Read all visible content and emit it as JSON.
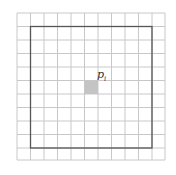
{
  "diagram": {
    "grid": {
      "x_lines": [
        17,
        30.5,
        44,
        57.5,
        71,
        84.5,
        98,
        111.5,
        125,
        138.5,
        152,
        165
      ],
      "y_lines": [
        13,
        26.5,
        40,
        53.5,
        67,
        80.5,
        94,
        107.5,
        121,
        134.5,
        148,
        160
      ],
      "line_color": "#c8c8c8"
    },
    "window": {
      "x": 30.5,
      "y": 26.5,
      "w": 121.5,
      "h": 121.5,
      "color": "#555555"
    },
    "highlight_cell": {
      "x": 84.5,
      "y": 80.5,
      "w": 13.5,
      "h": 13.5,
      "color": "#c4c4c4"
    },
    "label": {
      "text": "p",
      "subscript": "i",
      "x": 97,
      "y": 68
    }
  }
}
